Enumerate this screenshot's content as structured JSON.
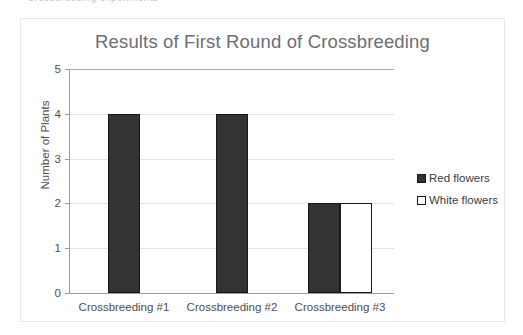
{
  "page": {
    "top_partial_text": "Crossbreeding experiments"
  },
  "chart_data": {
    "type": "bar",
    "title": "Results of First Round of Crossbreeding",
    "xlabel": "",
    "ylabel": "Number of Plants",
    "categories": [
      "Crossbreeding #1",
      "Crossbreeding #2",
      "Crossbreeding #3"
    ],
    "series": [
      {
        "name": "Red flowers",
        "color": "#333335",
        "values": [
          4,
          4,
          2
        ]
      },
      {
        "name": "White flowers",
        "color": "#ffffff",
        "values": [
          null,
          null,
          2
        ]
      }
    ],
    "ylim": [
      0,
      5
    ],
    "yticks": [
      0,
      1,
      2,
      3,
      4,
      5
    ],
    "ytick_labels": [
      "0",
      "1",
      "2",
      "3",
      "4",
      "5"
    ],
    "grid": true,
    "grid_axis": "y",
    "legend_position": "right",
    "legend": [
      {
        "label": "Red flowers",
        "swatch": "filled-dark-square"
      },
      {
        "label": "White flowers",
        "swatch": "outlined-white-square"
      }
    ],
    "colors": {
      "bar_fill_red": "#333335",
      "bar_fill_white": "#ffffff",
      "bar_border": "#191919",
      "gridline": "#e3e3e6",
      "axis": "#9a9a9e",
      "title_text": "#6d6d72",
      "label_text": "#4e4e52",
      "frame_border": "#e8e8ec",
      "background": "#ffffff"
    }
  }
}
